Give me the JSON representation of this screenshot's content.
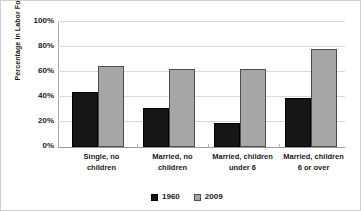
{
  "chart_data": {
    "type": "bar",
    "title": "",
    "xlabel": "",
    "ylabel": "Percentage in Labor Force",
    "ylim": [
      0,
      100
    ],
    "yticks": [
      "0%",
      "20%",
      "40%",
      "60%",
      "80%",
      "100%"
    ],
    "grid": true,
    "legend_position": "bottom",
    "categories": [
      "Single, no children",
      "Married, no children",
      "Married, children under 6",
      "Married, children 6 or over"
    ],
    "category_lines": [
      [
        "Single, no",
        "children"
      ],
      [
        "Married, no",
        "children"
      ],
      [
        "Married, children",
        "under 6"
      ],
      [
        "Married, children",
        "6 or over"
      ]
    ],
    "series": [
      {
        "name": "1960",
        "color": "#161616",
        "values": [
          44,
          31,
          19,
          39
        ]
      },
      {
        "name": "2009",
        "color": "#a6a6a6",
        "values": [
          64,
          62,
          62,
          78
        ]
      }
    ]
  },
  "legend": {
    "items": [
      {
        "label": "1960"
      },
      {
        "label": "2009"
      }
    ]
  }
}
